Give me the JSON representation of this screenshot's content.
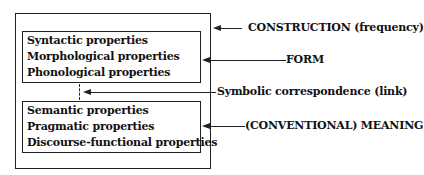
{
  "diagram": {
    "title": "",
    "outer_box": {
      "label": "CONSTRUCTION (frequency)"
    },
    "form_box": {
      "label": "FORM",
      "properties": [
        "Syntactic properties",
        "Morphological properties",
        "Phonological properties"
      ]
    },
    "link": {
      "label": "Symbolic correspondence (link)"
    },
    "meaning_box": {
      "label": "(CONVENTIONAL) MEANING",
      "properties": [
        "Semantic properties",
        "Pragmatic properties",
        "Discourse-functional properties"
      ]
    },
    "colors": {
      "line": "#222222",
      "text": "#111111",
      "background": "#ffffff"
    }
  }
}
